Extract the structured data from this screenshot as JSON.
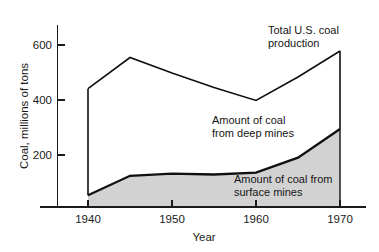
{
  "chart_data": {
    "type": "area",
    "title": "",
    "subtitle": "",
    "xlabel": "Year",
    "ylabel": "Coal, millions of tons",
    "xlim": [
      1940,
      1970
    ],
    "ylim": [
      0,
      640
    ],
    "xticks": [
      1940,
      1950,
      1960,
      1970
    ],
    "xticklabels": [
      "1940",
      "1950",
      "1960",
      "1970"
    ],
    "yticks": [
      200,
      400,
      600
    ],
    "yticklabels": [
      "200",
      "400",
      "600"
    ],
    "grid": false,
    "legend_position": "inline-annotations",
    "x": [
      1940,
      1945,
      1950,
      1955,
      1960,
      1965,
      1970
    ],
    "series": [
      {
        "name": "Total U.S. coal production",
        "values": [
          455,
          575,
          515,
          460,
          410,
          500,
          600
        ],
        "style": "line",
        "color": "#101010"
      },
      {
        "name": "Amount of coal from surface mines",
        "values": [
          45,
          120,
          128,
          125,
          132,
          190,
          300
        ],
        "style": "area-filled",
        "color": "#101010",
        "fill": "#d2d2d2"
      }
    ],
    "derived_series": [
      {
        "name": "Amount of coal from deep mines",
        "description": "Region between the surface-mines curve and the total production curve",
        "values": [
          410,
          455,
          387,
          335,
          278,
          310,
          300
        ]
      }
    ],
    "annotations": [
      {
        "name": "total-production-label",
        "lines": [
          "Total U.S. coal",
          "production"
        ],
        "x": 1963,
        "y": 625
      },
      {
        "name": "deep-mines-label",
        "lines": [
          "Amount of coal",
          "from deep mines"
        ],
        "x": 1949,
        "y": 330
      },
      {
        "name": "surface-mines-label",
        "lines": [
          "Amount of coal from",
          "surface mines"
        ],
        "x": 1956,
        "y": 110
      }
    ],
    "colors": {
      "axis": "#1a1a1a",
      "line": "#101010",
      "surface_fill": "#d2d2d2",
      "background": "#ffffff"
    }
  },
  "axes": {
    "y_title": "Coal, millions of tons",
    "x_title": "Year",
    "y_tick_0": "200",
    "y_tick_1": "400",
    "y_tick_2": "600",
    "x_tick_0": "1940",
    "x_tick_1": "1950",
    "x_tick_2": "1960",
    "x_tick_3": "1970"
  },
  "labels": {
    "total_line_1": "Total U.S. coal",
    "total_line_2": "production",
    "deep_line_1": "Amount of coal",
    "deep_line_2": "from deep mines",
    "surface_line_1": "Amount of coal from",
    "surface_line_2": "surface mines"
  }
}
